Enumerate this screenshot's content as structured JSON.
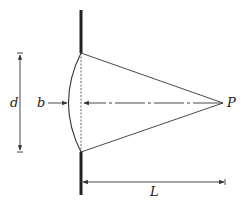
{
  "diagram": {
    "labels": {
      "d": "d",
      "b": "b",
      "P": "P",
      "L": "L"
    },
    "colors": {
      "line": "#333333",
      "wall": "#222222",
      "text": "#222222"
    }
  }
}
